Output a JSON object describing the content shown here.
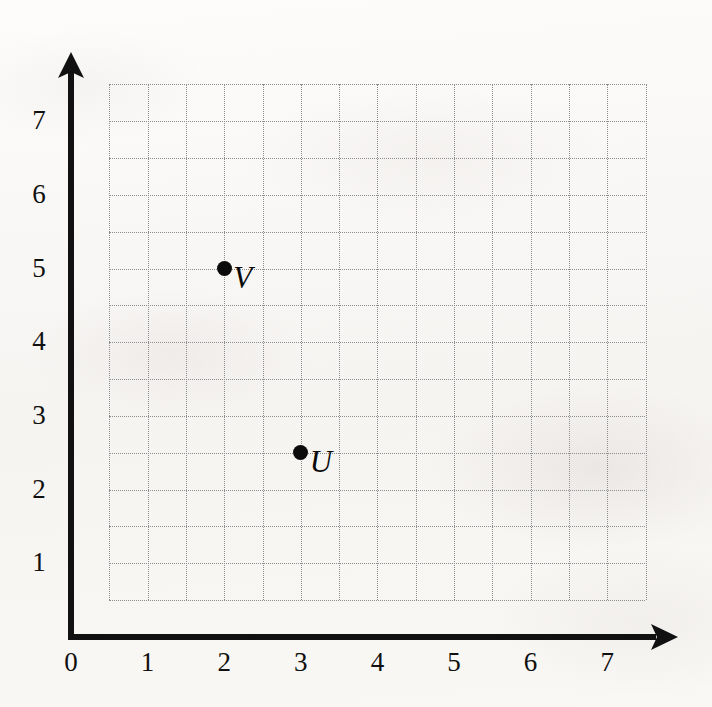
{
  "figure": {
    "kind": "coordinate-grid-scatter",
    "background_color": "#faf9f6",
    "ink_color": "#111111",
    "grid_color": "#8d8d8d"
  },
  "chart_data": {
    "type": "scatter",
    "title": "",
    "xlabel": "",
    "ylabel": "",
    "xlim": [
      0,
      7.7
    ],
    "ylim": [
      0,
      7.7
    ],
    "grid": true,
    "grid_step": 0.5,
    "grid_extent": {
      "x_min": 0.5,
      "x_max": 7.5,
      "y_min": 0.5,
      "y_max": 7.5
    },
    "legend": "none",
    "x_ticks": [
      0,
      1,
      2,
      3,
      4,
      5,
      6,
      7
    ],
    "y_ticks": [
      1,
      2,
      3,
      4,
      5,
      6,
      7
    ],
    "x_tick_labels": [
      "0",
      "1",
      "2",
      "3",
      "4",
      "5",
      "6",
      "7"
    ],
    "y_tick_labels": [
      "1",
      "2",
      "3",
      "4",
      "5",
      "6",
      "7"
    ],
    "origin_label": "0",
    "axis_arrows": {
      "x": "right",
      "y": "up"
    },
    "points": [
      {
        "label": "V",
        "x": 2,
        "y": 5,
        "label_side": "right"
      },
      {
        "label": "U",
        "x": 3,
        "y": 2.5,
        "label_side": "right"
      }
    ]
  }
}
